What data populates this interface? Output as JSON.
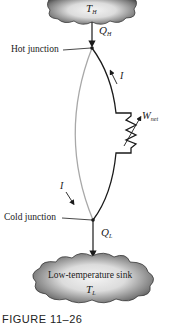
{
  "diagram": {
    "type": "thermoelectric-generator",
    "hot_reservoir": {
      "symbol": "T",
      "subscript": "H"
    },
    "heat_in": {
      "symbol": "Q",
      "subscript": "H"
    },
    "hot_junction_label": "Hot junction",
    "current_label_right": "I",
    "current_label_left": "I",
    "work": {
      "symbol": "W",
      "subscript": "net"
    },
    "cold_junction_label": "Cold junction",
    "heat_out": {
      "symbol": "Q",
      "subscript": "L"
    },
    "cold_reservoir": {
      "label": "Low-temperature sink",
      "symbol": "T",
      "subscript": "L"
    },
    "caption": "FIGURE 11–26",
    "colors": {
      "wire_dark": "#1a1a1a",
      "wire_light": "#a8a8a8",
      "cloud_dark": "#5a5a5a",
      "cloud_light": "#f2f2f2"
    }
  }
}
